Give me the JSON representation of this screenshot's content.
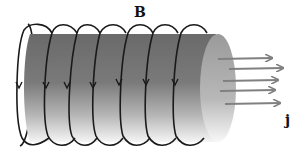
{
  "diagram": {
    "title": "",
    "labels": {
      "magnetic_field": "B",
      "current_density": "j"
    },
    "elements": {
      "conductor": {
        "shape": "cylinder",
        "color_dark": "#6e6e6e",
        "color_light": "#f2f2f2",
        "end_cap_color": "#a8a8a8"
      },
      "field_loops": {
        "count": 7,
        "color": "#1a1a1a",
        "arrow_direction": "down-front"
      },
      "current_arrows": {
        "count": 5,
        "color": "#808080",
        "direction": "right"
      }
    }
  }
}
